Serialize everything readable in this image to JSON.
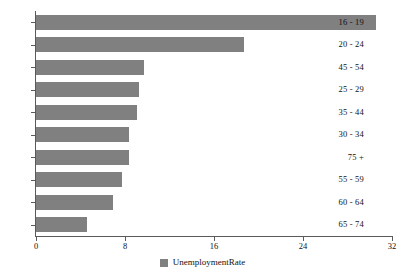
{
  "chart_data": {
    "type": "bar",
    "orientation": "horizontal",
    "title": "",
    "xlabel": "",
    "ylabel": "",
    "categories": [
      "16 - 19",
      "20 - 24",
      "45 - 54",
      "25 - 29",
      "35 - 44",
      "30 - 34",
      "75 +",
      "55 - 59",
      "60 - 64",
      "65 - 74"
    ],
    "series": [
      {
        "name": "UnemploymentRate",
        "color": "#808080",
        "values": [
          30.6,
          18.7,
          9.7,
          9.3,
          9.1,
          8.4,
          8.4,
          7.7,
          6.9,
          4.6
        ]
      }
    ],
    "xlim": [
      0,
      32
    ],
    "xticks": [
      "0",
      "8",
      "16",
      "24",
      "32"
    ],
    "xtick_values": [
      0,
      8,
      16,
      24,
      32
    ],
    "grid": false,
    "legend_position": "bottom"
  },
  "legend": {
    "entries": [
      {
        "label": "UnemploymentRate",
        "color": "#808080"
      }
    ]
  },
  "colors": {
    "bar": "#808080",
    "axis": "#5a5a5a",
    "text": "#111111",
    "background": "#ffffff"
  }
}
